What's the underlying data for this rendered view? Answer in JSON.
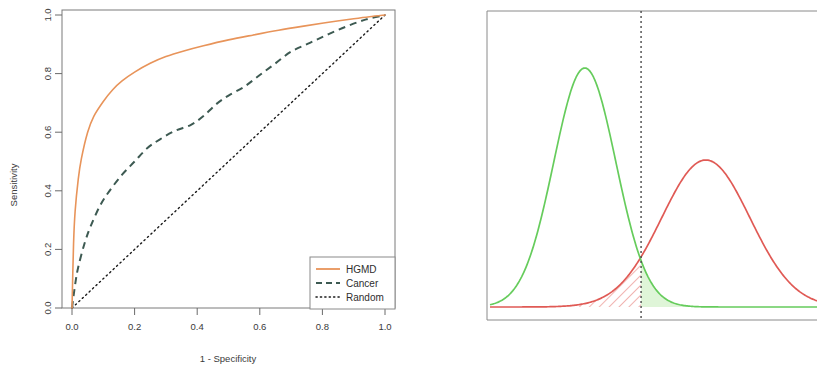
{
  "figure": {
    "title": "",
    "panels": [
      "roc-curve-panel",
      "density-distribution-panel"
    ]
  },
  "chart_data": [
    {
      "type": "line",
      "id": "roc-curve",
      "title": "",
      "xlabel": "1 - Specificity",
      "ylabel": "Sensitivity",
      "xlim": [
        0.0,
        1.0
      ],
      "ylim": [
        0.0,
        1.0
      ],
      "xticks": [
        "0.0",
        "0.2",
        "0.4",
        "0.6",
        "0.8",
        "1.0"
      ],
      "xtick_values": [
        0.0,
        0.2,
        0.4,
        0.6,
        0.8,
        1.0
      ],
      "yticks": [
        "0.0",
        "0.2",
        "0.4",
        "0.6",
        "0.8",
        "1.0"
      ],
      "ytick_values": [
        0.0,
        0.2,
        0.4,
        0.6,
        0.8,
        1.0
      ],
      "grid": false,
      "legend_position": "bottom-right",
      "series": [
        {
          "name": "HGMD",
          "color": "#E8945A",
          "linestyle": "solid",
          "legend_label": "HGMD",
          "x": [
            0.0,
            0.005,
            0.01,
            0.02,
            0.03,
            0.05,
            0.07,
            0.1,
            0.13,
            0.16,
            0.2,
            0.25,
            0.3,
            0.36,
            0.42,
            0.5,
            0.58,
            0.66,
            0.74,
            0.82,
            0.9,
            0.95,
            1.0
          ],
          "y": [
            0.0,
            0.22,
            0.33,
            0.44,
            0.51,
            0.6,
            0.655,
            0.705,
            0.745,
            0.775,
            0.805,
            0.835,
            0.858,
            0.878,
            0.895,
            0.915,
            0.932,
            0.948,
            0.962,
            0.975,
            0.987,
            0.994,
            1.0
          ]
        },
        {
          "name": "Cancer",
          "color": "#3D5A52",
          "linestyle": "dashed",
          "legend_label": "Cancer",
          "x": [
            0.0,
            0.01,
            0.02,
            0.04,
            0.06,
            0.09,
            0.12,
            0.16,
            0.2,
            0.24,
            0.28,
            0.33,
            0.38,
            0.42,
            0.46,
            0.5,
            0.55,
            0.6,
            0.65,
            0.7,
            0.76,
            0.82,
            0.88,
            0.94,
            1.0
          ],
          "y": [
            0.0,
            0.08,
            0.14,
            0.22,
            0.28,
            0.35,
            0.4,
            0.455,
            0.5,
            0.545,
            0.575,
            0.605,
            0.625,
            0.655,
            0.695,
            0.725,
            0.755,
            0.795,
            0.835,
            0.875,
            0.905,
            0.935,
            0.962,
            0.985,
            1.0
          ]
        },
        {
          "name": "Random",
          "color": "#1a1a1a",
          "linestyle": "dotted",
          "legend_label": "Random",
          "x": [
            0.0,
            1.0
          ],
          "y": [
            0.0,
            1.0
          ]
        }
      ]
    },
    {
      "type": "area",
      "id": "density-distributions",
      "title": "",
      "xlabel": "",
      "ylabel": "",
      "grid": false,
      "legend_position": "none",
      "threshold": {
        "value": 0.462,
        "linestyle": "dotted",
        "color": "#4a4a4a",
        "label": ""
      },
      "series": [
        {
          "name": "negatives-green",
          "color": "#66CC5C",
          "fill_color": "#DFF5D8",
          "fill_region": "right-of-threshold",
          "fill_pattern": "solid",
          "mean": 0.29,
          "sd": 0.095,
          "peak_height": 1.0
        },
        {
          "name": "positives-red",
          "color": "#E05A55",
          "fill_color": "#E05A55",
          "fill_region": "left-of-threshold",
          "fill_pattern": "diagonal-hatch",
          "mean": 0.66,
          "sd": 0.135,
          "peak_height": 0.615
        }
      ]
    }
  ],
  "roc": {
    "xlabel": "1 - Specificity",
    "ylabel": "Sensitivity",
    "xticks": [
      "0.0",
      "0.2",
      "0.4",
      "0.6",
      "0.8",
      "1.0"
    ],
    "yticks": [
      "0.0",
      "0.2",
      "0.4",
      "0.6",
      "0.8",
      "1.0"
    ],
    "legend": {
      "items": [
        {
          "label": "HGMD",
          "color": "#E8945A",
          "style": "solid"
        },
        {
          "label": "Cancer",
          "color": "#3D5A52",
          "style": "dashed"
        },
        {
          "label": "Random",
          "color": "#1a1a1a",
          "style": "dotted"
        }
      ]
    }
  },
  "density": {
    "green_color": "#66CC5C",
    "green_fill": "#DFF5D8",
    "red_color": "#E05A55",
    "threshold_color": "#4a4a4a"
  }
}
